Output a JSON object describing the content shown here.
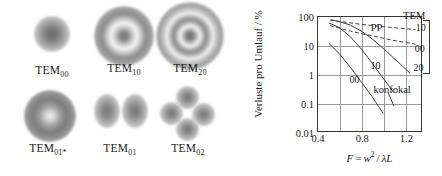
{
  "figure": {
    "modes": {
      "caption_prefix": "TEM",
      "items": [
        {
          "label": "TEM00",
          "label_base": "TEM",
          "label_sub": "00",
          "pattern": "gaussian-spot"
        },
        {
          "label": "TEM10",
          "label_base": "TEM",
          "label_sub": "10",
          "pattern": "one-ring-plus-core"
        },
        {
          "label": "TEM20",
          "label_base": "TEM",
          "label_sub": "20",
          "pattern": "two-rings-plus-core"
        },
        {
          "label": "TEM01*",
          "label_base": "TEM",
          "label_sub": "01*",
          "pattern": "doughnut"
        },
        {
          "label": "TEM01",
          "label_base": "TEM",
          "label_sub": "01",
          "pattern": "two-lobes"
        },
        {
          "label": "TEM02",
          "label_base": "TEM",
          "label_sub": "02",
          "pattern": "four-lobes"
        }
      ]
    },
    "chart_data": {
      "type": "line",
      "title": "",
      "xlabel": "F = w² / λL",
      "xlabel_parts": {
        "lhs": "F",
        "eq": "=",
        "num": "w",
        "num_sup": "2",
        "den": "λL"
      },
      "ylabel": "Verluste pro Umlauf / %",
      "xlim": [
        0.4,
        1.35
      ],
      "ylim": [
        0.01,
        100
      ],
      "yscale": "log",
      "grid": true,
      "xticks": [
        0.4,
        0.8,
        1.2
      ],
      "xtick_labels": [
        "0.4",
        "0.8",
        "1.2"
      ],
      "xgridlines": [
        0.6,
        0.8,
        1.0,
        1.2
      ],
      "yticks": [
        100,
        10,
        1,
        0.1,
        0.01
      ],
      "ytick_labels": [
        "100",
        "10",
        "1",
        "0.1",
        "0.01"
      ],
      "legend_position": "in-plot annotations",
      "legend_title": "TEM",
      "legend_entries": [
        "10",
        "00",
        "20"
      ],
      "annotations": [
        {
          "text": "PP",
          "x": 0.93,
          "y": 45
        },
        {
          "text": "TEM",
          "x": 1.27,
          "y": 120
        },
        {
          "text": "10",
          "x": 1.33,
          "y": 44
        },
        {
          "text": "00",
          "x": 1.32,
          "y": 8.5
        },
        {
          "text": "20",
          "x": 1.31,
          "y": 1.9
        },
        {
          "text": "10",
          "x": 0.92,
          "y": 2.2
        },
        {
          "text": "00",
          "x": 0.73,
          "y": 0.75
        },
        {
          "text": "konfokal",
          "x": 1.07,
          "y": 0.33
        }
      ],
      "series": [
        {
          "name": "PP TEM10",
          "style": "dashed",
          "points": [
            [
              0.51,
              78
            ],
            [
              0.6,
              70
            ],
            [
              0.7,
              62
            ],
            [
              0.8,
              55
            ],
            [
              0.9,
              50
            ],
            [
              1.0,
              46
            ],
            [
              1.1,
              42
            ],
            [
              1.2,
              39
            ],
            [
              1.3,
              36
            ]
          ]
        },
        {
          "name": "PP TEM00",
          "style": "dashed",
          "points": [
            [
              0.51,
              50
            ],
            [
              0.6,
              40
            ],
            [
              0.7,
              32
            ],
            [
              0.8,
              26
            ],
            [
              0.9,
              22
            ],
            [
              1.0,
              18
            ],
            [
              1.1,
              15
            ],
            [
              1.2,
              13
            ],
            [
              1.3,
              11
            ]
          ]
        },
        {
          "name": "konfokal TEM20",
          "style": "solid",
          "points": [
            [
              0.52,
              80
            ],
            [
              0.6,
              68
            ],
            [
              0.7,
              52
            ],
            [
              0.8,
              32
            ],
            [
              0.9,
              17
            ],
            [
              1.0,
              8.0
            ],
            [
              1.1,
              3.6
            ],
            [
              1.2,
              1.6
            ],
            [
              1.25,
              1.05
            ]
          ]
        },
        {
          "name": "konfokal TEM10",
          "style": "solid",
          "points": [
            [
              0.5,
              62
            ],
            [
              0.6,
              42
            ],
            [
              0.7,
              20
            ],
            [
              0.8,
              7.5
            ],
            [
              0.9,
              2.4
            ],
            [
              1.0,
              0.72
            ],
            [
              1.05,
              0.4
            ],
            [
              1.1,
              0.22
            ]
          ]
        },
        {
          "name": "konfokal TEM00",
          "style": "solid",
          "points": [
            [
              0.5,
              12
            ],
            [
              0.6,
              5.0
            ],
            [
              0.7,
              1.7
            ],
            [
              0.8,
              0.52
            ],
            [
              0.9,
              0.16
            ],
            [
              1.0,
              0.042
            ]
          ]
        }
      ],
      "pointers": [
        {
          "from": [
            1.05,
            0.21
          ],
          "to": [
            1.1,
            0.075
          ],
          "note": "konfokal leader"
        }
      ],
      "bracket": {
        "label": "TEM",
        "x": 1.35,
        "y_top": 80,
        "y_bottom": 1.3
      }
    }
  }
}
